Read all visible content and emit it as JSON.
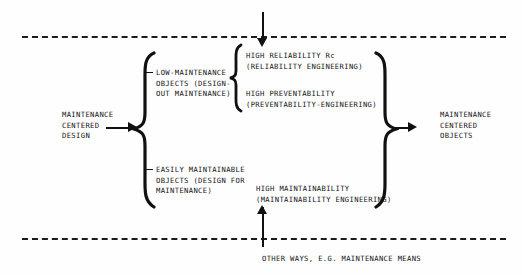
{
  "diagram": {
    "title_text": "Maintenance centered design flow",
    "inputs": {
      "left_label": "MAINTENANCE\nCENTERED\nDESIGN",
      "top_label": "",
      "bottom_label": "OTHER WAYS, E.G. MAINTENANCE MEANS"
    },
    "outputs": {
      "right_label": "MAINTENANCE\nCENTERED\nOBJECTS"
    },
    "branches": [
      {
        "id": "low-maintenance",
        "label": "LOW-MAINTENANCE\nOBJECTS (DESIGN-\nOUT MAINTENANCE)"
      },
      {
        "id": "easily-maintainable",
        "label": "EASILY MAINTAINABLE\nOBJECTS (DESIGN FOR\nMAINTENANCE)"
      }
    ],
    "attributes": [
      {
        "id": "high-reliability",
        "label": "HIGH RELIABILITY Rc\n(RELIABILITY ENGINEERING)"
      },
      {
        "id": "high-preventability",
        "label": "HIGH PREVENTABILITY\n(PREVENTABILITY-ENGINEERING)"
      },
      {
        "id": "high-maintainability",
        "label": "HIGH MAINTAINABILITY\n(MAINTAINABILITY ENGINEERING)"
      }
    ],
    "icons": {
      "arrow_right": "arrow-right-icon",
      "arrow_down": "arrow-down-icon",
      "arrow_up": "arrow-up-icon",
      "brace_left": "left-brace-icon",
      "brace_right": "right-brace-icon"
    },
    "colors": {
      "ink": "#151515",
      "paper": "#fefefe"
    }
  }
}
